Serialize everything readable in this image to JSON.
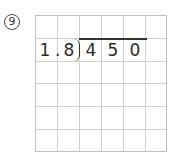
{
  "problem": {
    "number_label": "9",
    "divisor": {
      "digits": [
        "1",
        "8"
      ],
      "decimal_point": "."
    },
    "dividend": {
      "digits": [
        "4",
        "5",
        "0"
      ]
    },
    "grid": {
      "columns": 6,
      "rows": 6,
      "line_color": "#cfcfcf"
    }
  }
}
